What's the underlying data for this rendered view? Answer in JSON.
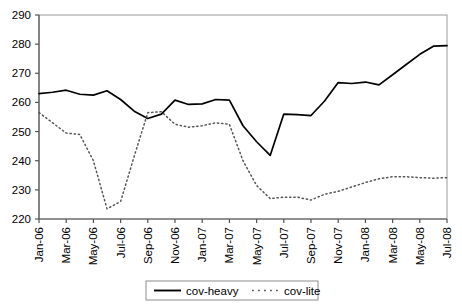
{
  "chart_data": {
    "type": "line",
    "title": "",
    "xlabel": "",
    "ylabel": "",
    "ylim": [
      220,
      290
    ],
    "yticks": [
      220,
      230,
      240,
      250,
      260,
      270,
      280,
      290
    ],
    "grid": false,
    "legend_position": "bottom-center",
    "x_tick_labels": [
      "Jan-06",
      "Mar-06",
      "May-06",
      "Jul-06",
      "Sep-06",
      "Nov-06",
      "Jan-07",
      "Mar-07",
      "May-07",
      "Jul-07",
      "Sep-07",
      "Nov-07",
      "Jan-08",
      "Mar-08",
      "May-08",
      "Jul-08"
    ],
    "x": [
      "Jan-06",
      "Feb-06",
      "Mar-06",
      "Apr-06",
      "May-06",
      "Jun-06",
      "Jul-06",
      "Aug-06",
      "Sep-06",
      "Oct-06",
      "Nov-06",
      "Dec-06",
      "Jan-07",
      "Feb-07",
      "Mar-07",
      "Apr-07",
      "May-07",
      "Jun-07",
      "Jul-07",
      "Aug-07",
      "Sep-07",
      "Oct-07",
      "Nov-07",
      "Dec-07",
      "Jan-08",
      "Feb-08",
      "Mar-08",
      "Apr-08",
      "May-08",
      "Jun-08",
      "Jul-08"
    ],
    "series": [
      {
        "name": "cov-heavy",
        "style": "solid",
        "color": "#000000",
        "values": [
          263.0,
          263.5,
          264.2,
          262.8,
          262.5,
          264.0,
          261.0,
          257.0,
          254.5,
          256.0,
          260.8,
          259.3,
          259.5,
          261.0,
          260.8,
          252.0,
          246.5,
          241.8,
          256.0,
          255.8,
          255.5,
          260.5,
          266.8,
          266.5,
          267.0,
          266.0,
          269.5,
          273.0,
          276.5,
          279.3,
          279.5
        ]
      },
      {
        "name": "cov-lite",
        "style": "dotted",
        "color": "#555555",
        "values": [
          256.5,
          253.0,
          249.5,
          249.0,
          240.0,
          223.5,
          226.0,
          241.5,
          256.5,
          256.8,
          252.5,
          251.5,
          252.0,
          253.0,
          252.5,
          240.0,
          231.5,
          227.0,
          227.5,
          227.5,
          226.5,
          228.5,
          229.5,
          231.0,
          232.5,
          233.8,
          234.5,
          234.5,
          234.2,
          234.0,
          234.2
        ]
      }
    ]
  },
  "legend": {
    "items": [
      {
        "label": "cov-heavy",
        "style": "solid"
      },
      {
        "label": "cov-lite",
        "style": "dotted"
      }
    ]
  }
}
